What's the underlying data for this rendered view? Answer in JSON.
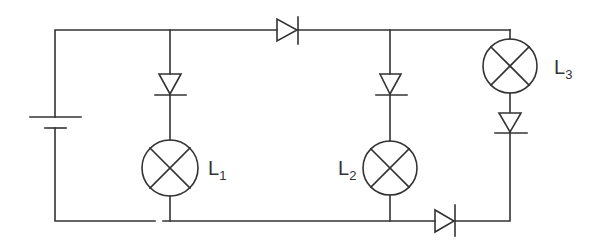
{
  "diagram": {
    "type": "circuit",
    "stroke_color": "#333333",
    "background": "#ffffff",
    "components": {
      "battery": {
        "name": "battery"
      },
      "diodes": [
        {
          "id": "d-top",
          "orientation": "right"
        },
        {
          "id": "d-branch1",
          "orientation": "down"
        },
        {
          "id": "d-branch2",
          "orientation": "down"
        },
        {
          "id": "d-branch3",
          "orientation": "down"
        },
        {
          "id": "d-bottom",
          "orientation": "right"
        }
      ],
      "lamps": [
        {
          "id": "L1",
          "label": "L",
          "subscript": "1"
        },
        {
          "id": "L2",
          "label": "L",
          "subscript": "2"
        },
        {
          "id": "L3",
          "label": "L",
          "subscript": "3"
        }
      ]
    }
  }
}
